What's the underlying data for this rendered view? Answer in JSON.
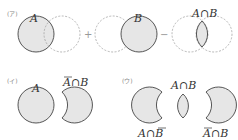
{
  "sections": {
    "a": {
      "tag": "(ア)",
      "label_a": "A",
      "label_b": "B",
      "label_ab": "A∩B",
      "plus": "+",
      "minus": "−"
    },
    "i": {
      "tag": "(イ)",
      "label_a": "A",
      "label_nab": "A∩B"
    },
    "u": {
      "tag": "(ウ)",
      "label_ab": "A∩B",
      "label_anb": "A∩B",
      "label_nab": "A∩B"
    }
  },
  "colors": {
    "fill": "#e6e6e6",
    "stroke": "#444444",
    "dashed": "#999999"
  }
}
